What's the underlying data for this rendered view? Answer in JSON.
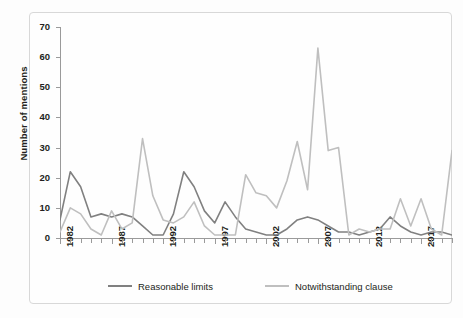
{
  "chart_data": {
    "type": "line",
    "title": "",
    "xlabel": "",
    "ylabel": "Number of mentions",
    "xlim": [
      1982,
      2020
    ],
    "ylim": [
      0,
      70
    ],
    "yticks": [
      0,
      10,
      20,
      30,
      40,
      50,
      60,
      70
    ],
    "xticks": [
      1982,
      1987,
      1992,
      1997,
      2002,
      2007,
      2012,
      2017
    ],
    "grid": false,
    "legend_position": "bottom",
    "x": [
      1982,
      1983,
      1984,
      1985,
      1986,
      1987,
      1988,
      1989,
      1990,
      1991,
      1992,
      1993,
      1994,
      1995,
      1996,
      1997,
      1998,
      1999,
      2000,
      2001,
      2002,
      2003,
      2004,
      2005,
      2006,
      2007,
      2008,
      2009,
      2010,
      2011,
      2012,
      2013,
      2014,
      2015,
      2016,
      2017,
      2018,
      2019,
      2020
    ],
    "series": [
      {
        "name": "Reasonable limits",
        "color": "#808080",
        "values": [
          6,
          22,
          17,
          7,
          8,
          7,
          8,
          7,
          4,
          1,
          1,
          8,
          22,
          17,
          9,
          5,
          12,
          7,
          3,
          2,
          1,
          1,
          3,
          6,
          7,
          6,
          4,
          2,
          2,
          1,
          2,
          3,
          7,
          4,
          2,
          1,
          2,
          2,
          1
        ]
      },
      {
        "name": "Notwithstanding clause",
        "color": "#bfbfbf",
        "values": [
          2,
          10,
          8,
          3,
          1,
          9,
          3,
          5,
          33,
          14,
          6,
          5,
          7,
          12,
          4,
          1,
          1,
          1,
          21,
          15,
          14,
          10,
          19,
          32,
          16,
          63,
          29,
          30,
          1,
          3,
          2,
          3,
          3,
          13,
          4,
          13,
          3,
          1,
          29
        ]
      }
    ],
    "peak": {
      "year": 2007,
      "value": 63,
      "series": "Notwithstanding clause"
    }
  },
  "legend": {
    "items": [
      {
        "label": "Reasonable limits",
        "color": "#808080"
      },
      {
        "label": "Notwithstanding clause",
        "color": "#bfbfbf"
      }
    ]
  },
  "axis": {
    "y_title": "Number of mentions",
    "y_tick_labels": [
      "0",
      "10",
      "20",
      "30",
      "40",
      "50",
      "60",
      "70"
    ],
    "x_tick_labels": [
      "1982",
      "1987",
      "1992",
      "1997",
      "2002",
      "2007",
      "2012",
      "2017"
    ]
  }
}
